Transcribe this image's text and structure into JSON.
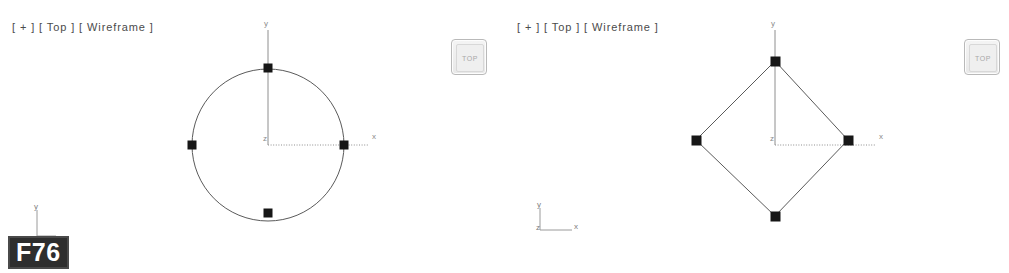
{
  "app": {
    "background_color": "#ffffff",
    "clipped_header_text": "3d perspective tool — curve degree comparison"
  },
  "viewports": [
    {
      "id": "left",
      "hud_label": "[ + ] [ Top ] [ Wireframe ]",
      "hud_parts": {
        "menu": "+",
        "view": "Top",
        "shading": "Wireframe"
      },
      "viewcube_label": "TOP",
      "axis_labels": {
        "x": "x",
        "y": "y",
        "z": "z"
      },
      "curve": {
        "name": "nurbs-circle",
        "type": "circle",
        "degree": 3,
        "center_px": [
          268,
          145
        ],
        "radius_px": 76,
        "control_vertices": [
          {
            "label": "cv-top",
            "x": 268,
            "y": 68
          },
          {
            "label": "cv-right",
            "x": 344,
            "y": 145
          },
          {
            "label": "cv-bottom",
            "x": 268,
            "y": 213
          },
          {
            "label": "cv-left",
            "x": 192,
            "y": 145
          }
        ]
      }
    },
    {
      "id": "right",
      "hud_label": "[ + ] [ Top ] [ Wireframe ]",
      "hud_parts": {
        "menu": "+",
        "view": "Top",
        "shading": "Wireframe"
      },
      "viewcube_label": "TOP",
      "axis_labels": {
        "x": "x",
        "y": "y",
        "z": "z"
      },
      "curve": {
        "name": "degree-one-diamond",
        "type": "polyline",
        "degree": 1,
        "center_px": [
          773,
          145
        ],
        "control_vertices": [
          {
            "label": "cv-top",
            "x": 775,
            "y": 66
          },
          {
            "label": "cv-right",
            "x": 848,
            "y": 145
          },
          {
            "label": "cv-bottom",
            "x": 775,
            "y": 221
          },
          {
            "label": "cv-left",
            "x": 696,
            "y": 145
          }
        ]
      }
    }
  ],
  "world_tripod": {
    "labels": {
      "y": "y",
      "z": "z",
      "x": "x"
    }
  },
  "frame_badge": {
    "label": "F76"
  },
  "colors": {
    "curve": "#5a5a5a",
    "control_vertex": "#171717",
    "axis": "#8e8e8e",
    "hud_text": "#4b4b4b",
    "badge_background": "#2e2e2e",
    "badge_text": "#ffffff"
  }
}
